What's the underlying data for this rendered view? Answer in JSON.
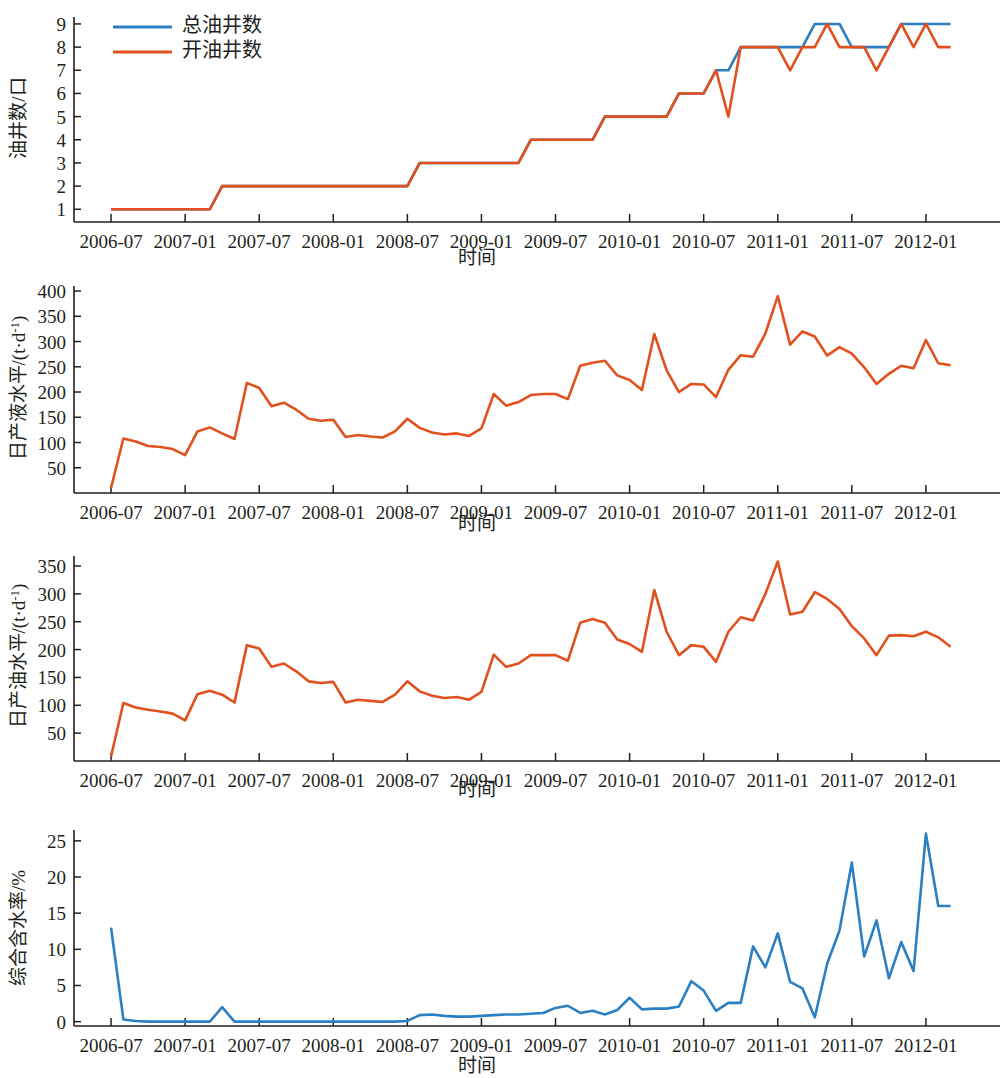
{
  "figure": {
    "background": "#ffffff",
    "colors": {
      "blue": "#2b7fc3",
      "orange": "#e2501e",
      "axis": "#231f20"
    }
  },
  "legend": {
    "position": "top-left-panel-1",
    "entries": [
      {
        "label": "总油井数",
        "color": "#2b7fc3"
      },
      {
        "label": "开油井数",
        "color": "#e2501e"
      }
    ]
  },
  "shared": {
    "xlabel": "时间",
    "xticklabels": [
      "2006-07",
      "2007-01",
      "2007-07",
      "2008-01",
      "2008-07",
      "2009-01",
      "2009-07",
      "2010-01",
      "2010-07",
      "2011-01",
      "2011-07",
      "2012-01"
    ],
    "xtickmonths": [
      0,
      6,
      12,
      18,
      24,
      30,
      36,
      42,
      48,
      54,
      60,
      66
    ],
    "xlim_months": [
      -3,
      72
    ]
  },
  "chart_data": [
    {
      "id": "well-count",
      "type": "line",
      "title": "",
      "xlabel": "时间",
      "ylabel": "油井数/口",
      "ylim": [
        0.45,
        9.3
      ],
      "yticks": [
        1,
        2,
        3,
        4,
        5,
        6,
        7,
        8,
        9
      ],
      "yticklabels": [
        "1",
        "2",
        "3",
        "4",
        "5",
        "6",
        "7",
        "8",
        "9"
      ],
      "grid": false,
      "x_months": [
        0,
        1,
        2,
        3,
        4,
        5,
        6,
        7,
        8,
        9,
        10,
        11,
        12,
        13,
        14,
        15,
        16,
        17,
        18,
        19,
        20,
        21,
        22,
        23,
        24,
        25,
        26,
        27,
        28,
        29,
        30,
        31,
        32,
        33,
        34,
        35,
        36,
        37,
        38,
        39,
        40,
        41,
        42,
        43,
        44,
        45,
        46,
        47,
        48,
        49,
        50,
        51,
        52,
        53,
        54,
        55,
        56,
        57,
        58,
        59,
        60,
        61,
        62,
        63,
        64,
        65,
        66,
        67,
        68
      ],
      "series": [
        {
          "name": "总油井数",
          "color": "#2b7fc3",
          "values": [
            1,
            1,
            1,
            1,
            1,
            1,
            1,
            1,
            1,
            2,
            2,
            2,
            2,
            2,
            2,
            2,
            2,
            2,
            2,
            2,
            2,
            2,
            2,
            2,
            2,
            3,
            3,
            3,
            3,
            3,
            3,
            3,
            3,
            3,
            4,
            4,
            4,
            4,
            4,
            4,
            5,
            5,
            5,
            5,
            5,
            5,
            6,
            6,
            6,
            7,
            7,
            8,
            8,
            8,
            8,
            8,
            8,
            9,
            9,
            9,
            8,
            8,
            8,
            8,
            9,
            9,
            9,
            9,
            9
          ]
        },
        {
          "name": "开油井数",
          "color": "#e2501e",
          "values": [
            1,
            1,
            1,
            1,
            1,
            1,
            1,
            1,
            1,
            2,
            2,
            2,
            2,
            2,
            2,
            2,
            2,
            2,
            2,
            2,
            2,
            2,
            2,
            2,
            2,
            3,
            3,
            3,
            3,
            3,
            3,
            3,
            3,
            3,
            4,
            4,
            4,
            4,
            4,
            4,
            5,
            5,
            5,
            5,
            5,
            5,
            6,
            6,
            6,
            7,
            5,
            8,
            8,
            8,
            8,
            7,
            8,
            8,
            9,
            8,
            8,
            8,
            7,
            8,
            9,
            8,
            9,
            8,
            8
          ]
        }
      ]
    },
    {
      "id": "daily-liquid",
      "type": "line",
      "title": "",
      "xlabel": "时间",
      "ylabel": "日产液水平/(t·d⁻¹)",
      "ylim": [
        0,
        410
      ],
      "yticks": [
        50,
        100,
        150,
        200,
        250,
        300,
        350,
        400
      ],
      "yticklabels": [
        "50",
        "100",
        "150",
        "200",
        "250",
        "300",
        "350",
        "400"
      ],
      "grid": false,
      "x_months": [
        0,
        1,
        2,
        3,
        4,
        5,
        6,
        7,
        8,
        9,
        10,
        11,
        12,
        13,
        14,
        15,
        16,
        17,
        18,
        19,
        20,
        21,
        22,
        23,
        24,
        25,
        26,
        27,
        28,
        29,
        30,
        31,
        32,
        33,
        34,
        35,
        36,
        37,
        38,
        39,
        40,
        41,
        42,
        43,
        44,
        45,
        46,
        47,
        48,
        49,
        50,
        51,
        52,
        53,
        54,
        55,
        56,
        57,
        58,
        59,
        60,
        61,
        62,
        63,
        64,
        65,
        66,
        67,
        68
      ],
      "series": [
        {
          "name": "日产液水平",
          "color": "#e2501e",
          "values": [
            10,
            108,
            102,
            93,
            91,
            87,
            75,
            122,
            130,
            118,
            107,
            218,
            208,
            172,
            179,
            165,
            147,
            143,
            145,
            111,
            115,
            112,
            110,
            122,
            147,
            129,
            120,
            116,
            118,
            113,
            128,
            196,
            173,
            180,
            194,
            196,
            196,
            186,
            252,
            258,
            262,
            233,
            224,
            204,
            315,
            243,
            200,
            216,
            215,
            190,
            244,
            273,
            270,
            316,
            390,
            294,
            320,
            310,
            272,
            289,
            276,
            249,
            216,
            236,
            252,
            247,
            303,
            257,
            253
          ]
        }
      ]
    },
    {
      "id": "daily-oil",
      "type": "line",
      "title": "",
      "xlabel": "时间",
      "ylabel": "日产油水平/(t·d⁻¹)",
      "ylim": [
        0,
        368
      ],
      "yticks": [
        50,
        100,
        150,
        200,
        250,
        300,
        350
      ],
      "yticklabels": [
        "50",
        "100",
        "150",
        "200",
        "250",
        "300",
        "350"
      ],
      "grid": false,
      "x_months": [
        0,
        1,
        2,
        3,
        4,
        5,
        6,
        7,
        8,
        9,
        10,
        11,
        12,
        13,
        14,
        15,
        16,
        17,
        18,
        19,
        20,
        21,
        22,
        23,
        24,
        25,
        26,
        27,
        28,
        29,
        30,
        31,
        32,
        33,
        34,
        35,
        36,
        37,
        38,
        39,
        40,
        41,
        42,
        43,
        44,
        45,
        46,
        47,
        48,
        49,
        50,
        51,
        52,
        53,
        54,
        55,
        56,
        57,
        58,
        59,
        60,
        61,
        62,
        63,
        64,
        65,
        66,
        67,
        68
      ],
      "series": [
        {
          "name": "日产油水平",
          "color": "#e2501e",
          "values": [
            8,
            104,
            96,
            92,
            89,
            85,
            73,
            120,
            126,
            119,
            105,
            208,
            202,
            169,
            175,
            161,
            143,
            140,
            142,
            105,
            110,
            108,
            106,
            119,
            143,
            125,
            117,
            113,
            115,
            110,
            124,
            191,
            169,
            175,
            190,
            190,
            190,
            180,
            248,
            255,
            248,
            218,
            210,
            196,
            307,
            232,
            190,
            208,
            205,
            178,
            232,
            258,
            252,
            300,
            358,
            263,
            268,
            303,
            291,
            273,
            242,
            220,
            190,
            225,
            226,
            224,
            232,
            222,
            205
          ]
        }
      ]
    },
    {
      "id": "water-cut",
      "type": "line",
      "title": "",
      "xlabel": "时间",
      "ylabel": "综合含水率/%",
      "ylim": [
        -0.6,
        26.5
      ],
      "yticks": [
        0,
        5,
        10,
        15,
        20,
        25
      ],
      "yticklabels": [
        "0",
        "5",
        "10",
        "15",
        "20",
        "25"
      ],
      "grid": false,
      "x_months": [
        0,
        1,
        2,
        3,
        4,
        5,
        6,
        7,
        8,
        9,
        10,
        11,
        12,
        13,
        14,
        15,
        16,
        17,
        18,
        19,
        20,
        21,
        22,
        23,
        24,
        25,
        26,
        27,
        28,
        29,
        30,
        31,
        32,
        33,
        34,
        35,
        36,
        37,
        38,
        39,
        40,
        41,
        42,
        43,
        44,
        45,
        46,
        47,
        48,
        49,
        50,
        51,
        52,
        53,
        54,
        55,
        56,
        57,
        58,
        59,
        60,
        61,
        62,
        63,
        64,
        65,
        66,
        67,
        68
      ],
      "series": [
        {
          "name": "综合含水率",
          "color": "#2b7fc3",
          "values": [
            13.0,
            0.3,
            0.1,
            0.0,
            0.0,
            0.0,
            0.0,
            0.0,
            0.0,
            2.0,
            0.0,
            0.0,
            0.0,
            0.0,
            0.0,
            0.0,
            0.0,
            0.0,
            0.0,
            0.0,
            0.0,
            0.0,
            0.0,
            0.0,
            0.1,
            0.9,
            1.0,
            0.8,
            0.7,
            0.7,
            0.8,
            0.9,
            1.0,
            1.0,
            1.1,
            1.2,
            1.9,
            2.2,
            1.2,
            1.5,
            1.0,
            1.6,
            3.3,
            1.7,
            1.8,
            1.8,
            2.1,
            5.6,
            4.3,
            1.5,
            2.6,
            2.6,
            10.4,
            7.5,
            12.2,
            5.5,
            4.6,
            0.6,
            8.0,
            12.6,
            22.0,
            9.0,
            14.0,
            6.0,
            11.0,
            7.0,
            26.0,
            16.0,
            16.0
          ]
        }
      ]
    }
  ]
}
